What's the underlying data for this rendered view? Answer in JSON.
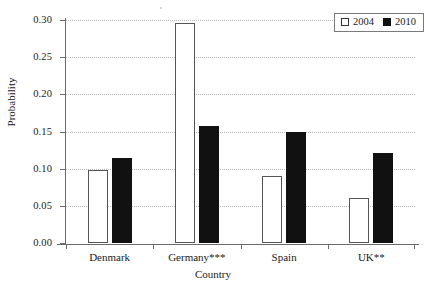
{
  "chart_data": {
    "type": "bar",
    "title": "",
    "xlabel": "Country",
    "ylabel": "Probability",
    "categories": [
      "Denmark",
      "Germany***",
      "Spain",
      "UK**"
    ],
    "series": [
      {
        "name": "2004",
        "values": [
          0.098,
          0.296,
          0.09,
          0.06
        ],
        "color": "#ffffff"
      },
      {
        "name": "2010",
        "values": [
          0.115,
          0.158,
          0.149,
          0.121
        ],
        "color": "#111111"
      }
    ],
    "ylim": [
      0.0,
      0.3
    ],
    "yticks": [
      "0.00",
      "0.05",
      "0.10",
      "0.15",
      "0.20",
      "0.25",
      "0.30"
    ],
    "ytick_values": [
      0.0,
      0.05,
      0.1,
      0.15,
      0.2,
      0.25,
      0.3
    ],
    "grid": true,
    "grid_axis": "y",
    "grid_style": "dotted",
    "legend": {
      "position": "top-right",
      "entries": [
        "2004",
        "2010"
      ]
    }
  },
  "colors": {
    "axis": "#6b6b6b",
    "grid": "#b9b9b9",
    "bar_2004_fill": "#ffffff",
    "bar_2004_edge": "#555555",
    "bar_2010_fill": "#111111",
    "background": "#ffffff"
  }
}
